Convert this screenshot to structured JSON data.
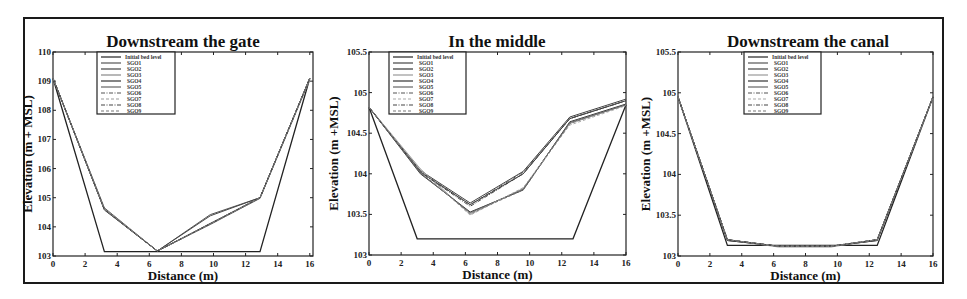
{
  "figure": {
    "panel_count": 3
  },
  "chart_data": [
    {
      "type": "line",
      "title": "Downstream the gate",
      "xlabel": "Distance (m)",
      "ylabel": "Elevation (m + MSL)",
      "xlim": [
        0,
        16.2
      ],
      "ylim": [
        103,
        110
      ],
      "xticks": [
        0,
        2,
        4,
        6,
        8,
        10,
        12,
        14,
        16
      ],
      "yticks": [
        103,
        104,
        105,
        106,
        107,
        108,
        109,
        110
      ],
      "ytick_labels": [
        "103",
        "104",
        "105",
        "106",
        "107",
        "108",
        "109",
        "110"
      ],
      "legend": "top-left",
      "series": [
        {
          "name": "Initial bed level",
          "x": [
            0,
            3.2,
            12.9,
            16
          ],
          "y": [
            109.1,
            103.15,
            103.15,
            109.1
          ],
          "style": "solid",
          "color": "#222222"
        },
        {
          "name": "SGO1",
          "x": [
            0,
            3.2,
            6.5,
            9.8,
            12.9,
            16
          ],
          "y": [
            109.1,
            104.65,
            103.17,
            104.42,
            105.0,
            109.1
          ],
          "style": "solid",
          "color": "#555555"
        },
        {
          "name": "SGO2",
          "x": [
            0,
            3.2,
            6.5,
            9.8,
            12.9,
            16
          ],
          "y": [
            109.1,
            104.6,
            103.17,
            104.38,
            105.0,
            109.1
          ],
          "style": "solid",
          "color": "#444444"
        },
        {
          "name": "SGO3",
          "x": [
            0,
            3.2,
            6.5,
            9.8,
            12.9,
            16
          ],
          "y": [
            109.1,
            104.62,
            103.17,
            104.1,
            104.98,
            109.05
          ],
          "style": "solid",
          "color": "#888888"
        },
        {
          "name": "SGO4",
          "x": [
            0,
            3.2,
            6.5,
            9.8,
            12.9,
            16
          ],
          "y": [
            109.1,
            104.58,
            103.17,
            104.12,
            105.0,
            109.1
          ],
          "style": "solid",
          "color": "#333333"
        },
        {
          "name": "SGO5",
          "x": [
            0,
            3.2,
            6.5,
            9.8,
            12.9,
            16
          ],
          "y": [
            109.1,
            104.6,
            103.17,
            104.08,
            104.98,
            109.1
          ],
          "style": "solid",
          "color": "#666666"
        },
        {
          "name": "SGO6",
          "x": [
            0,
            3.2,
            6.5,
            9.8,
            12.9,
            16
          ],
          "y": [
            109.1,
            104.6,
            103.17,
            104.1,
            105.0,
            109.1
          ],
          "style": "dashdot",
          "color": "#555555"
        },
        {
          "name": "SGO7",
          "x": [
            0,
            3.2,
            6.5,
            9.8,
            12.9,
            16
          ],
          "y": [
            109.1,
            104.62,
            103.17,
            104.1,
            105.0,
            109.1
          ],
          "style": "dashed",
          "color": "#999999"
        },
        {
          "name": "SGO8",
          "x": [
            0,
            3.2,
            6.5,
            9.8,
            12.9,
            16
          ],
          "y": [
            109.1,
            104.6,
            103.17,
            104.1,
            105.0,
            109.1
          ],
          "style": "dashdot",
          "color": "#444444"
        },
        {
          "name": "SGO9",
          "x": [
            0,
            3.2,
            6.5,
            9.8,
            12.9,
            16
          ],
          "y": [
            109.1,
            104.6,
            103.17,
            104.1,
            105.0,
            109.1
          ],
          "style": "dashed",
          "color": "#777777"
        }
      ]
    },
    {
      "type": "line",
      "title": "In the middle",
      "xlabel": "Distance (m)",
      "ylabel": "Elevation (m +MSL)",
      "xlim": [
        0,
        16
      ],
      "ylim": [
        103,
        105.5
      ],
      "xticks": [
        0,
        2,
        4,
        6,
        8,
        10,
        12,
        14,
        16
      ],
      "yticks": [
        103,
        103.5,
        104,
        104.5,
        105,
        105.5
      ],
      "ytick_labels": [
        "103",
        "103.5",
        "104",
        "104.5",
        "105",
        "105.5"
      ],
      "legend": "top-left",
      "series": [
        {
          "name": "Initial bed level",
          "x": [
            0,
            3.0,
            12.7,
            16
          ],
          "y": [
            104.82,
            103.2,
            103.2,
            104.85
          ],
          "style": "solid",
          "color": "#222222"
        },
        {
          "name": "SGO1",
          "x": [
            0,
            3.2,
            6.3,
            9.6,
            12.5,
            16
          ],
          "y": [
            104.82,
            104.04,
            103.64,
            104.03,
            104.7,
            104.92
          ],
          "style": "solid",
          "color": "#444444"
        },
        {
          "name": "SGO2",
          "x": [
            0,
            3.2,
            6.3,
            9.6,
            12.5,
            16
          ],
          "y": [
            104.82,
            104.02,
            103.62,
            104.0,
            104.68,
            104.9
          ],
          "style": "solid",
          "color": "#333333"
        },
        {
          "name": "SGO3",
          "x": [
            0,
            3.2,
            6.3,
            9.6,
            12.5,
            16
          ],
          "y": [
            104.82,
            104.06,
            103.5,
            103.82,
            104.62,
            104.85
          ],
          "style": "solid",
          "color": "#999999"
        },
        {
          "name": "SGO4",
          "x": [
            0,
            3.2,
            6.3,
            9.6,
            12.5,
            16
          ],
          "y": [
            104.82,
            104.0,
            103.53,
            103.8,
            104.64,
            104.86
          ],
          "style": "solid",
          "color": "#333333"
        },
        {
          "name": "SGO5",
          "x": [
            0,
            3.2,
            6.3,
            9.6,
            12.5,
            16
          ],
          "y": [
            104.82,
            104.01,
            103.52,
            103.81,
            104.63,
            104.85
          ],
          "style": "solid",
          "color": "#666666"
        },
        {
          "name": "SGO6",
          "x": [
            0,
            3.2,
            6.3,
            9.6,
            12.5,
            16
          ],
          "y": [
            104.82,
            104.03,
            103.62,
            104.02,
            104.68,
            104.9
          ],
          "style": "dashdot",
          "color": "#555555"
        },
        {
          "name": "SGO7",
          "x": [
            0,
            3.2,
            6.3,
            9.6,
            12.5,
            16
          ],
          "y": [
            104.82,
            104.05,
            103.49,
            103.83,
            104.6,
            104.84
          ],
          "style": "dashed",
          "color": "#aaaaaa"
        },
        {
          "name": "SGO8",
          "x": [
            0,
            3.2,
            6.3,
            9.6,
            12.5,
            16
          ],
          "y": [
            104.82,
            104.02,
            103.6,
            104.0,
            104.68,
            104.9
          ],
          "style": "dashdot",
          "color": "#444444"
        },
        {
          "name": "SGO9",
          "x": [
            0,
            3.2,
            6.3,
            9.6,
            12.5,
            16
          ],
          "y": [
            104.82,
            104.02,
            103.51,
            103.8,
            104.62,
            104.85
          ],
          "style": "dashed",
          "color": "#777777"
        }
      ]
    },
    {
      "type": "line",
      "title": "Downstream the canal",
      "xlabel": "Distance (m)",
      "ylabel": "Elevation (m +MSL)",
      "xlim": [
        0,
        16
      ],
      "ylim": [
        103,
        105.5
      ],
      "xticks": [
        0,
        2,
        4,
        6,
        8,
        10,
        12,
        14,
        16
      ],
      "yticks": [
        103,
        103.5,
        104,
        104.5,
        105,
        105.5
      ],
      "ytick_labels": [
        "103",
        "103.5",
        "104",
        "104.5",
        "105",
        "105.5"
      ],
      "legend": "top-center",
      "series": [
        {
          "name": "Initial bed level",
          "x": [
            0,
            3.1,
            12.5,
            16
          ],
          "y": [
            104.95,
            103.13,
            103.13,
            104.95
          ],
          "style": "solid",
          "color": "#222222"
        },
        {
          "name": "SGO1",
          "x": [
            0,
            3.1,
            6.3,
            9.6,
            12.5,
            16
          ],
          "y": [
            104.95,
            103.2,
            103.12,
            103.12,
            103.2,
            104.95
          ],
          "style": "solid",
          "color": "#555555"
        },
        {
          "name": "SGO2",
          "x": [
            0,
            3.1,
            6.3,
            9.6,
            12.5,
            16
          ],
          "y": [
            104.95,
            103.19,
            103.12,
            103.12,
            103.19,
            104.95
          ],
          "style": "solid",
          "color": "#444444"
        },
        {
          "name": "SGO3",
          "x": [
            0,
            3.1,
            6.3,
            9.6,
            12.5,
            16
          ],
          "y": [
            104.95,
            103.2,
            103.11,
            103.11,
            103.2,
            104.94
          ],
          "style": "solid",
          "color": "#999999"
        },
        {
          "name": "SGO4",
          "x": [
            0,
            3.1,
            6.3,
            9.6,
            12.5,
            16
          ],
          "y": [
            104.95,
            103.19,
            103.12,
            103.12,
            103.19,
            104.95
          ],
          "style": "solid",
          "color": "#333333"
        },
        {
          "name": "SGO5",
          "x": [
            0,
            3.1,
            6.3,
            9.6,
            12.5,
            16
          ],
          "y": [
            104.95,
            103.2,
            103.12,
            103.12,
            103.2,
            104.95
          ],
          "style": "solid",
          "color": "#666666"
        },
        {
          "name": "SGO6",
          "x": [
            0,
            3.1,
            6.3,
            9.6,
            12.5,
            16
          ],
          "y": [
            104.95,
            103.2,
            103.12,
            103.12,
            103.2,
            104.95
          ],
          "style": "dashdot",
          "color": "#555555"
        },
        {
          "name": "SGO7",
          "x": [
            0,
            3.1,
            6.3,
            9.6,
            12.5,
            16
          ],
          "y": [
            104.95,
            103.2,
            103.12,
            103.12,
            103.2,
            104.95
          ],
          "style": "dashed",
          "color": "#aaaaaa"
        },
        {
          "name": "SGO8",
          "x": [
            0,
            3.1,
            6.3,
            9.6,
            12.5,
            16
          ],
          "y": [
            104.95,
            103.2,
            103.12,
            103.12,
            103.2,
            104.95
          ],
          "style": "dashdot",
          "color": "#444444"
        },
        {
          "name": "SGO9",
          "x": [
            0,
            3.1,
            6.3,
            9.6,
            12.5,
            16
          ],
          "y": [
            104.95,
            103.2,
            103.12,
            103.12,
            103.2,
            104.95
          ],
          "style": "dashed",
          "color": "#777777"
        }
      ]
    }
  ]
}
